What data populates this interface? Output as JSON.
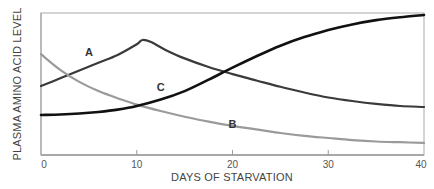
{
  "chart_data": {
    "type": "line",
    "title": "",
    "xlabel": "DAYS OF STARVATION",
    "ylabel": "PLASMA AMINO ACID LEVEL",
    "xlim": [
      0,
      40
    ],
    "ylim": [
      0,
      100
    ],
    "y_units": "relative (no numeric scale shown)",
    "x_ticks": [
      0,
      10,
      20,
      30,
      40
    ],
    "x_tick_labels": [
      "0",
      "10",
      "20",
      "30",
      "40"
    ],
    "grid": false,
    "legend": "none (curves labeled inline)",
    "series": [
      {
        "name": "A",
        "color": "#3a3a3a",
        "x": [
          0,
          2,
          4,
          6,
          8,
          10,
          10.6,
          11.5,
          13,
          15,
          17.5,
          20,
          22.5,
          25,
          27.5,
          30,
          32.5,
          35,
          37.5,
          40
        ],
        "values": [
          48.6,
          54,
          59.5,
          65,
          70.5,
          78,
          81,
          79.5,
          74,
          68,
          62,
          57,
          52.5,
          48,
          44,
          40.5,
          38,
          36,
          34.5,
          33.8
        ],
        "label_position": [
          5,
          70
        ]
      },
      {
        "name": "B",
        "color": "#9a9a9a",
        "x": [
          0,
          2,
          4,
          6,
          8,
          10,
          12.5,
          15,
          17.5,
          20,
          22.5,
          25,
          27.5,
          30,
          32.5,
          35,
          37.5,
          40
        ],
        "values": [
          71,
          60,
          51.5,
          45,
          40,
          35.5,
          31,
          27,
          23.5,
          20.5,
          18,
          15.5,
          13.5,
          12,
          10.5,
          9.5,
          9,
          8.5
        ],
        "label_position": [
          20,
          19
        ]
      },
      {
        "name": "C",
        "color": "#111111",
        "x": [
          0,
          2,
          4,
          6,
          8,
          10,
          12.5,
          15,
          17.5,
          20,
          22.5,
          25,
          27.5,
          30,
          32.5,
          35,
          37.5,
          40
        ],
        "values": [
          28.2,
          28.5,
          29.2,
          30.3,
          32,
          34.5,
          39,
          45,
          53,
          61.5,
          69.5,
          77,
          83,
          88,
          92,
          95,
          97,
          98.6
        ],
        "label_position": [
          12.5,
          45
        ]
      }
    ]
  }
}
